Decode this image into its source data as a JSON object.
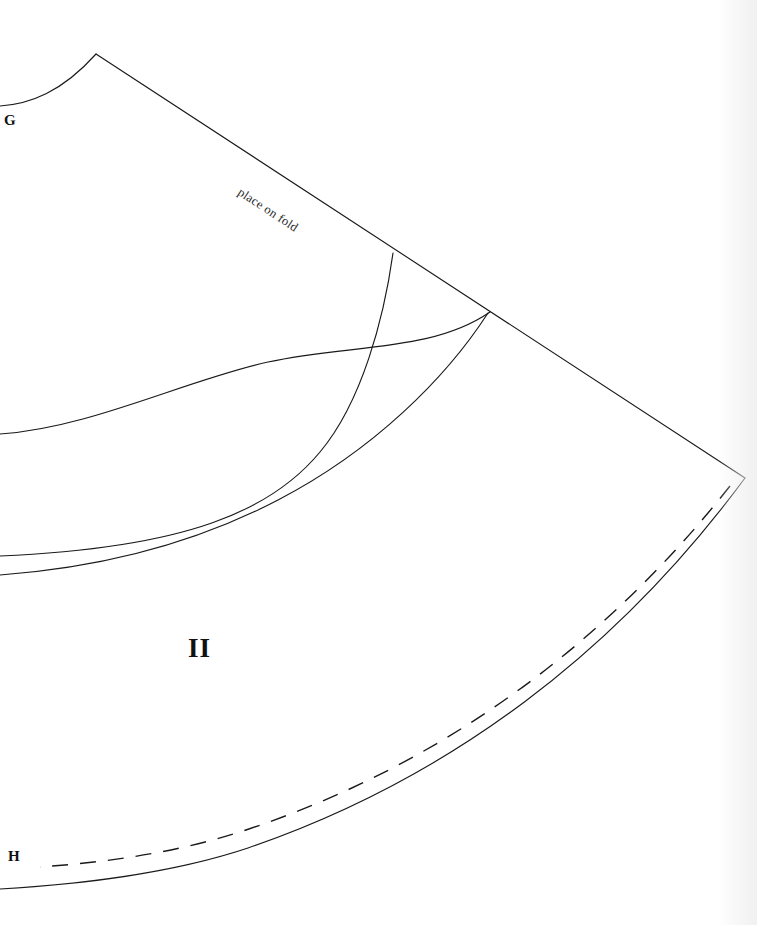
{
  "sheet": {
    "width": 757,
    "height": 925,
    "background_color": "#ffffff",
    "ink_color": "#1a1a1a"
  },
  "labels": {
    "corner_top_left": "G",
    "corner_bottom_left": "H",
    "piece_number": "II",
    "fold_instruction": "place on fold"
  },
  "diagram": {
    "type": "sewing-pattern",
    "piece_name": "II",
    "fold_edge": {
      "name": "place-on-fold-edge",
      "kind": "straight",
      "from": [
        96,
        54
      ],
      "to": [
        745,
        478
      ],
      "angle_degrees": 33.2
    },
    "vertices": {
      "apex": [
        96,
        54
      ],
      "right_corner": [
        745,
        478
      ]
    },
    "curves": [
      {
        "name": "shoulder-curve-G",
        "style": "solid",
        "path": "M 0 106 C 30 104 62 92 96 54",
        "endpoints": [
          [
            0,
            106
          ],
          [
            96,
            54
          ]
        ]
      },
      {
        "name": "upper-style-curve",
        "style": "solid",
        "path": "M 0 434 C 90 428 186 380 268 362 C 352 344 432 352 490 312",
        "endpoints": [
          [
            0,
            434
          ],
          [
            490,
            312
          ]
        ]
      },
      {
        "name": "inner-seam-curve",
        "style": "solid",
        "path": "M 393 253 C 384 318 362 402 320 452 C 272 510 188 548 0 556",
        "endpoints": [
          [
            393,
            253
          ],
          [
            0,
            556
          ]
        ]
      },
      {
        "name": "waist-seam-curve",
        "style": "solid",
        "path": "M 488 313 C 446 378 374 450 278 500 C 190 546 96 568 0 575",
        "endpoints": [
          [
            488,
            313
          ],
          [
            0,
            575
          ]
        ]
      },
      {
        "name": "hem-arc",
        "style": "solid",
        "path": "M 745 478 C 618 650 452 778 248 848 C 170 874 82 884 0 889",
        "endpoints": [
          [
            745,
            478
          ],
          [
            0,
            889
          ]
        ]
      },
      {
        "name": "hem-allowance-dashed",
        "style": "dashed",
        "path": "M 730 486 C 606 643 444 764 246 830 C 176 853 108 862 40 867",
        "endpoints": [
          [
            730,
            486
          ],
          [
            40,
            867
          ]
        ],
        "dash_length": 16,
        "gap_length": 12
      }
    ]
  }
}
